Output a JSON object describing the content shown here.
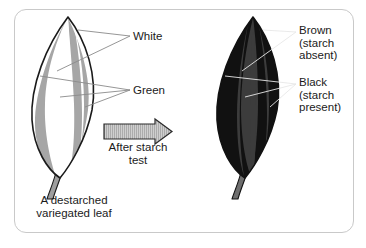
{
  "diagram": {
    "background_color": "#ffffff",
    "card_border_color": "#c9c9c9"
  },
  "left_leaf": {
    "name": "destarched-variegated-leaf",
    "caption": "A destarched\nvariegated leaf",
    "outline_color": "#1a1a1a",
    "blade_base_color": "#ffffff",
    "stripe_color": "#a6a6a6",
    "stem_color": "#9e9e9e",
    "labels": [
      {
        "id": "white",
        "text": "White",
        "color": "#ffffff"
      },
      {
        "id": "green",
        "text": "Green",
        "color": "#a6a6a6"
      }
    ]
  },
  "right_leaf": {
    "name": "leaf-after-starch-test",
    "outline_color": "#111111",
    "blade_base_color": "#111111",
    "stripe_color": "#3c3c3c",
    "stem_color": "#6e6e6e",
    "labels": [
      {
        "id": "brown",
        "text": "Brown\n(starch\nabsent)",
        "color": "#3c3c3c"
      },
      {
        "id": "black",
        "text": "Black\n(starch\npresent)",
        "color": "#111111"
      }
    ]
  },
  "arrow": {
    "name": "after-starch-test-arrow",
    "caption": "After starch\ntest",
    "fill_color": "#bdbdbd",
    "outline_color": "#2b2b2b",
    "direction": "right"
  },
  "leader_lines": {
    "left_color": "#8a8a8a",
    "right_color": "#e8e8e8"
  }
}
